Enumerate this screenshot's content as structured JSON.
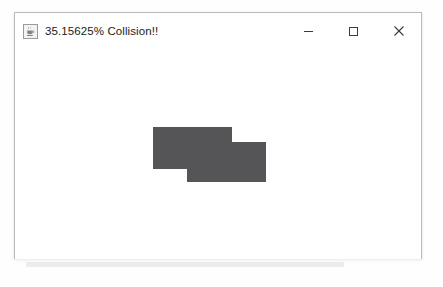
{
  "window": {
    "title": "35.15625% Collision!!",
    "icon": "java-coffee-cup-icon",
    "frame": {
      "x": 14,
      "y": 12,
      "width": 408,
      "height": 247
    },
    "background_color": "#ffffff",
    "border_color": "#b9b9bd"
  },
  "title_bar": {
    "controls": [
      {
        "name": "minimize-button",
        "glyph": "—",
        "label": "Minimize"
      },
      {
        "name": "maximize-button",
        "glyph": "□",
        "label": "Maximize"
      },
      {
        "name": "close-button",
        "glyph": "✕",
        "label": "Close"
      }
    ]
  },
  "canvas": {
    "background_color": "#ffffff",
    "shape_color": "#555558",
    "shapes": [
      {
        "name": "rectangle-one",
        "x": 138,
        "y": 77,
        "width": 79,
        "height": 42
      },
      {
        "name": "rectangle-two",
        "x": 172,
        "y": 92,
        "width": 79,
        "height": 40
      }
    ]
  },
  "backdrop": {
    "lines": [
      {
        "text": "on the page. In some cases, the layout can be adjusted to fit",
        "x": 16,
        "y": 120
      },
      {
        "text": "WPF window, which is then rendered in Windows",
        "x": 18,
        "y": 133
      },
      {
        "text": "vertically. If you do not see this content, it means that",
        "x": 18,
        "y": 146
      },
      {
        "text": "e of the form window has been adjusted to fit.",
        "x": 20,
        "y": 159
      },
      {
        "text": "in collision detection, the overlap area between",
        "x": 16,
        "y": 188
      },
      {
        "text": "two rectangles is calculated as a percentage",
        "x": 18,
        "y": 201
      },
      {
        "text": "of the total combined bounding region of both",
        "x": 16,
        "y": 214
      },
      {
        "text": "the primary shape and the secondary shape.",
        "x": 18,
        "y": 227
      }
    ]
  }
}
